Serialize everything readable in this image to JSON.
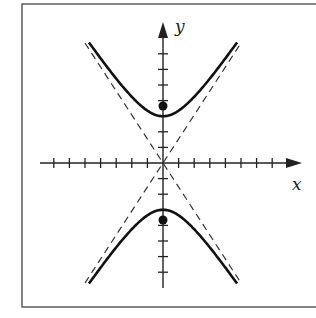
{
  "figure": {
    "type": "hyperbola-graph",
    "equation_implied": "y^2/9 - x^2/4 = 1",
    "axes": {
      "x_label": "x",
      "y_label": "y",
      "x_ticks_each_side": 7,
      "y_ticks_above": 7,
      "y_ticks_below": 7,
      "tick_spacing_units": 1
    },
    "hyperbola": {
      "orientation": "vertical",
      "a": 3,
      "b": 2,
      "vertices": [
        [
          0,
          3
        ],
        [
          0,
          -3
        ]
      ],
      "foci": [
        [
          0,
          3.6
        ],
        [
          0,
          -3.6
        ]
      ],
      "asymptotes": [
        "y = 1.5x",
        "y = -1.5x"
      ],
      "asymptote_style": "dashed"
    },
    "marked_points": [
      {
        "name": "focus-upper",
        "x": 0,
        "y": 3.6
      },
      {
        "name": "focus-lower",
        "x": 0,
        "y": -3.6
      }
    ],
    "colors": {
      "stroke": "#222222",
      "frame": "#444444",
      "background": "#ffffff"
    }
  }
}
